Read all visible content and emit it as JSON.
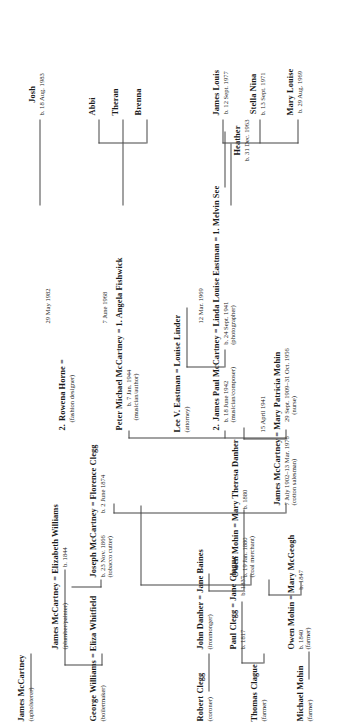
{
  "chart_title": "McCartney family tree",
  "generations": {
    "g1": [
      {
        "id": "james_mccartney_sr",
        "name": "James McCartney",
        "occupation": "(upholsterer)"
      },
      {
        "id": "george_williams",
        "name": "George Williams",
        "occupation": "(boilermaker)",
        "spouse": "Eliza Whitfield",
        "eq": "="
      },
      {
        "id": "robert_clegg",
        "name": "Robert Clegg",
        "occupation": "(coroner)"
      },
      {
        "id": "thomas_clague",
        "name": "Thomas Clague",
        "occupation": "(farmer)"
      },
      {
        "id": "michael_mohin",
        "name": "Michael Mohin",
        "occupation": "(farmer)"
      },
      {
        "id": "owen_mohin_sr",
        "name": "Owen Mohin",
        "occupation": "(farmer)",
        "spouse": "Mary McGeogh",
        "eq": "=",
        "birth": "b. 1840",
        "spouse_birth": "b. 1847"
      },
      {
        "id": "john_danher",
        "name": "John Danher",
        "occupation": "(ironmonger)",
        "spouse": "Jane Baines",
        "eq": "="
      }
    ],
    "g2": [
      {
        "id": "james_mccartney_2",
        "name": "James McCartney",
        "occupation": "(plumber/painter)",
        "spouse": "Elizabeth Williams",
        "eq": "=",
        "spouse_birth": "b. 1844"
      },
      {
        "id": "paul_clegg",
        "name": "Paul Clegg",
        "occupation": "",
        "birth": "b. 1817",
        "spouse": "Jane Clague",
        "eq": "=",
        "spouse_birth": "b. 1837"
      },
      {
        "id": "owen_mohin_2",
        "name": "Owen Mohin",
        "birth": "b. 19 Jan. 1880",
        "occupation": "(coal merchant)",
        "spouse": "Mary Theresa Danher",
        "eq": "=",
        "spouse_birth": "b. 1880"
      }
    ],
    "g3": [
      {
        "id": "joseph_mccartney",
        "name": "Joseph McCartney",
        "birth": "b. 23 Nov. 1866",
        "occupation": "(tobacco cutter)",
        "spouse": "Florence Clegg",
        "eq": "=",
        "spouse_birth": "b. 2 June 1874"
      },
      {
        "id": "lee_eastman",
        "name": "Lee V. Eastman",
        "occupation": "(attorney)",
        "spouse": "Louise Linder",
        "eq": "="
      }
    ],
    "g4": [
      {
        "id": "james_mccartney_3",
        "name": "James McCartney",
        "birth": "7 July 1902–13 Mar. 1976",
        "occupation": "(cotton salesman)",
        "eq": "=",
        "spouse": "Mary Patricia Mohin",
        "spouse_birth": "29 Sept. 1909–31 Oct. 1956",
        "spouse_occupation": "(nurse)",
        "marriage_date": "15 April 1941"
      }
    ],
    "g5": [
      {
        "id": "paul_mccartney",
        "order": "2.",
        "name": "James Paul McCartney",
        "birth": "b. 18 June 1942",
        "occupation": "(musician/composer)",
        "eq": "=",
        "spouse": "Linda Louise Eastman",
        "spouse_birth": "b. 24 Sept. 1941",
        "spouse_occupation": "(photographer)",
        "marriage_date": "12 Mar. 1969",
        "spouse_prior_eq": "=",
        "spouse_prior": "1. Melvin See"
      },
      {
        "id": "mike_mccartney",
        "name": "Peter Michael McCartney",
        "birth": "b. 7 Jan. 1944",
        "occupation": "(musician/author)",
        "eq": "=",
        "spouse": "1. Angela Fishwick",
        "marriage_date": "7 June 1968"
      },
      {
        "id": "rowena_horne",
        "order": "2.",
        "name": "Rowena Horne",
        "occupation": "(fashion designer)",
        "eq": "=",
        "marriage_date": "29 May 1982"
      }
    ],
    "g6": [
      {
        "id": "heather",
        "name": "Heather",
        "birth": "b. 31 Dec. 1963"
      },
      {
        "id": "mary_louise",
        "name": "Mary Louise",
        "birth": "b. 29 Aug. 1969"
      },
      {
        "id": "stella_nina",
        "name": "Stella Nina",
        "birth": "b. 13 Sept. 1971"
      },
      {
        "id": "james_louis",
        "name": "James Louis",
        "birth": "b. 12 Sept. 1977"
      },
      {
        "id": "benna",
        "name": "Brenna"
      },
      {
        "id": "theran",
        "name": "Theran"
      },
      {
        "id": "abbi",
        "name": "Abbi"
      },
      {
        "id": "josh",
        "name": "Josh",
        "birth": "b. 18 Aug. 1983"
      }
    ]
  },
  "colors": {
    "ink": "#1a1a1a",
    "line": "#444444",
    "background": "#ffffff"
  }
}
